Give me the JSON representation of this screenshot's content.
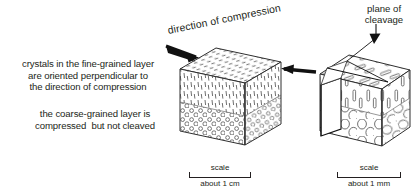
{
  "figure": {
    "captions": {
      "fine_layer": "crystals in the fine-grained layer\nare oriented perpendicular to\nthe direction of compression",
      "coarse_layer": "the coarse-grained layer is\ncompressed  but not cleaved"
    },
    "labels": {
      "compression": "direction of compression",
      "cleavage": "plane of\ncleavage"
    },
    "scales": [
      {
        "id": "left",
        "title": "scale",
        "note": "about 1 cm"
      },
      {
        "id": "right",
        "title": "scale",
        "note": "about 1 mm"
      }
    ],
    "colors": {
      "ink": "#231f20",
      "line": "#3a3a3a",
      "fill": "#ffffff",
      "background": "#ffffff"
    }
  }
}
